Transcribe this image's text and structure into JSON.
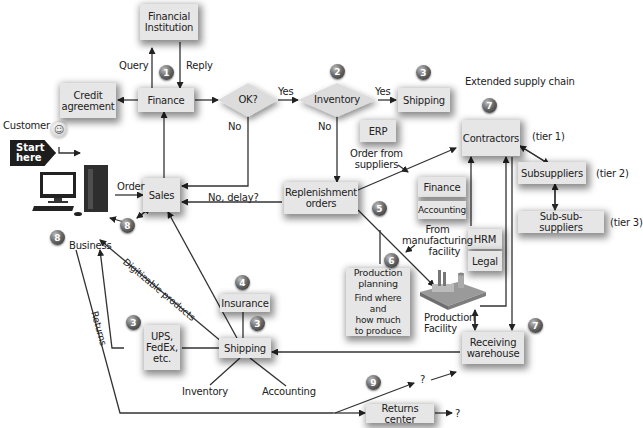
{
  "diagram": {
    "nodes": {
      "financial_institution": "Financial Institution",
      "financial_institution_l1": "Financial",
      "financial_institution_l2": "Institution",
      "credit_agreement_l1": "Credit",
      "credit_agreement_l2": "agreement",
      "finance": "Finance",
      "ok_decision": "OK?",
      "inventory_decision": "Inventory",
      "shipping_top": "Shipping",
      "erp": "ERP",
      "contractors": "Contractors",
      "subsuppliers": "Subsuppliers",
      "sub_sub_suppliers": "Sub-sub-suppliers",
      "sales": "Sales",
      "replenishment_l1": "Replenishment",
      "replenishment_l2": "orders",
      "finance_side": "Finance",
      "accounting_side": "Accounting",
      "hrm": "HRM",
      "legal": "Legal",
      "production_planning_l1": "Production",
      "production_planning_l2": "planning",
      "production_planning_note_l1": "Find where and",
      "production_planning_note_l2": "how much",
      "production_planning_note_l3": "to produce",
      "insurance": "Insurance",
      "shipping_bottom": "Shipping",
      "ups_l1": "UPS,",
      "ups_l2": "FedEx,",
      "ups_l3": "etc.",
      "receiving_l1": "Receiving",
      "receiving_l2": "warehouse",
      "returns_center": "Returns center"
    },
    "labels": {
      "query": "Query",
      "reply": "Reply",
      "customer": "Customer",
      "start_l1": "Start",
      "start_l2": "here",
      "order": "Order",
      "business": "Business",
      "yes1": "Yes",
      "yes2": "Yes",
      "no1": "No",
      "no2": "No",
      "no_delay": "No, delay?",
      "extended_supply_chain": "Extended supply chain",
      "tier1": "(tier 1)",
      "tier2": "(tier 2)",
      "tier3": "(tier 3)",
      "order_from_l1": "Order from",
      "order_from_l2": "suppliers",
      "from_mfg_l1": "From",
      "from_mfg_l2": "manufacturing",
      "from_mfg_l3": "facility",
      "production_facility_l1": "Production",
      "production_facility_l2": "Facility",
      "digitizable": "Digitizable products",
      "returns": "Returns",
      "inventory_leg": "Inventory",
      "accounting_leg": "Accounting",
      "question1": "?",
      "question2": "?"
    },
    "step_numbers": {
      "n1": "1",
      "n2": "2",
      "n3_top": "3",
      "n3_ups": "3",
      "n3_ship": "3",
      "n4": "4",
      "n5": "5",
      "n6": "6",
      "n7_top": "7",
      "n7_bottom": "7",
      "n8_a": "8",
      "n8_b": "8",
      "n9": "9"
    },
    "colors": {
      "box_fill": "#e6e6e6",
      "line": "#333333",
      "badge": "#555555",
      "start_badge": "#1d1d1d"
    }
  }
}
